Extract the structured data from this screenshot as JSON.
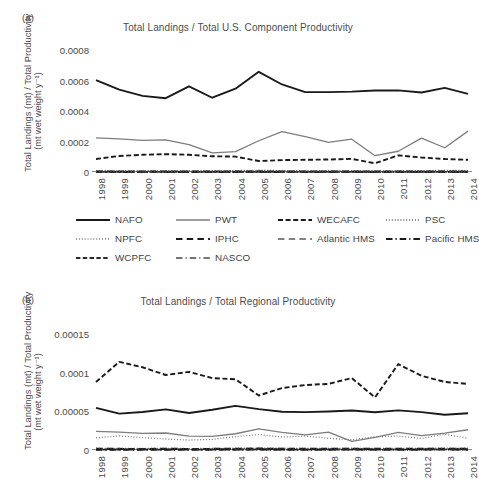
{
  "figure": {
    "panel_a_label": "(a)",
    "panel_b_label": "(b)",
    "ylabel_line1": "Total Landings (mt) / Total Productivity",
    "ylabel_line2": "(mt wet weight y⁻¹)"
  },
  "legend": {
    "rows": [
      [
        {
          "label": "NAFO",
          "style": "solid",
          "color": "#1a1a1a",
          "width": 1.9
        },
        {
          "label": "PWT",
          "style": "solid",
          "color": "#7d7d7d",
          "width": 1.3
        },
        {
          "label": "WECAFC",
          "style": "dashed",
          "color": "#1a1a1a",
          "width": 1.9
        },
        {
          "label": "PSC",
          "style": "dotted",
          "color": "#4a4a4a",
          "width": 1.4
        }
      ],
      [
        {
          "label": "NPFC",
          "style": "dotted",
          "color": "#6e6e6e",
          "width": 1.3
        },
        {
          "label": "IPHC",
          "style": "longdash",
          "color": "#1a1a1a",
          "width": 2.1
        },
        {
          "label": "Atlantic HMS",
          "style": "longdash",
          "color": "#5a5a5a",
          "width": 1.5
        },
        {
          "label": "Pacific HMS",
          "style": "dashdot",
          "color": "#1a1a1a",
          "width": 2.0
        }
      ],
      [
        {
          "label": "WCPFC",
          "style": "meddash",
          "color": "#2a2a2a",
          "width": 1.8
        },
        {
          "label": "NASCO",
          "style": "dashdot",
          "color": "#4a4a4a",
          "width": 1.5
        }
      ]
    ]
  },
  "chart_data": [
    {
      "type": "line",
      "panel": "a",
      "title": "Total Landings / Total U.S. Component Productivity",
      "xlabel": "",
      "ylabel": "Total Landings (mt) / Total Productivity (mt wet weight y⁻¹)",
      "x": [
        1998,
        1999,
        2000,
        2001,
        2002,
        2003,
        2004,
        2005,
        2006,
        2007,
        2008,
        2009,
        2010,
        2011,
        2012,
        2013,
        2014
      ],
      "xtick_labels": [
        "1998",
        "1999",
        "2000",
        "2001",
        "2002",
        "2003",
        "2004",
        "2005",
        "2006",
        "2007",
        "2008",
        "2009",
        "2010",
        "2011",
        "2012",
        "2013",
        "2014"
      ],
      "ylim": [
        0,
        0.0008
      ],
      "yticks": [
        0,
        0.0002,
        0.0004,
        0.0006,
        0.0008
      ],
      "ytick_labels": [
        "0",
        "0.0002",
        "0.0004",
        "0.0006",
        "0.0008"
      ],
      "grid": false,
      "legend_position": "below",
      "series": [
        {
          "name": "NAFO",
          "style": "solid",
          "color": "#1a1a1a",
          "width": 1.9,
          "values": [
            0.000602,
            0.00054,
            0.000499,
            0.000484,
            0.000562,
            0.000487,
            0.000546,
            0.000657,
            0.000574,
            0.000524,
            0.000524,
            0.000527,
            0.000534,
            0.000535,
            0.000521,
            0.000552,
            0.000512,
            0.000481,
            0.000521
          ]
        },
        {
          "name": "PWT",
          "style": "solid",
          "color": "#7d7d7d",
          "width": 1.3,
          "values": [
            0.000224,
            0.000217,
            0.000208,
            0.00021,
            0.000179,
            0.000126,
            0.000134,
            0.000205,
            0.000265,
            0.000232,
            0.000194,
            0.000215,
            0.000107,
            0.000136,
            0.000222,
            0.000159,
            0.000268
          ]
        },
        {
          "name": "WECAFC",
          "style": "dashed",
          "color": "#1a1a1a",
          "width": 1.9,
          "values": [
            8.5e-05,
            0.000105,
            0.000113,
            0.000117,
            0.000113,
            0.000103,
            0.000101,
            7.2e-05,
            7.8e-05,
            8e-05,
            8.2e-05,
            8.6e-05,
            5.7e-05,
            0.000109,
            9.5e-05,
            8.5e-05,
            8e-05
          ]
        },
        {
          "name": "PSC",
          "style": "dotted",
          "color": "#4a4a4a",
          "width": 1.4,
          "values": [
            8.5e-06,
            7.5e-06,
            7e-06,
            8e-06,
            6.8e-06,
            7.2e-06,
            9e-06,
            1.1e-05,
            8.6e-06,
            7.5e-06,
            8e-06,
            8.8e-06,
            7.2e-06,
            7.8e-06,
            8.2e-06,
            1.05e-05,
            9e-06
          ]
        },
        {
          "name": "NPFC",
          "style": "dotted",
          "color": "#6e6e6e",
          "width": 1.3,
          "values": [
            5e-06,
            4.5e-06,
            4.2e-06,
            4.8e-06,
            4e-06,
            4.4e-06,
            5.2e-06,
            6e-06,
            5e-06,
            4.6e-06,
            4.8e-06,
            5.2e-06,
            4.4e-06,
            4.7e-06,
            4.9e-06,
            5.8e-06,
            5.2e-06
          ]
        },
        {
          "name": "IPHC",
          "style": "longdash",
          "color": "#1a1a1a",
          "width": 2.1,
          "values": [
            3.2e-06,
            3e-06,
            2.8e-06,
            3.1e-06,
            2.7e-06,
            2.9e-06,
            3.4e-06,
            3.8e-06,
            3.3e-06,
            3e-06,
            3.1e-06,
            3.4e-06,
            2.9e-06,
            3.1e-06,
            3.2e-06,
            3.7e-06,
            3.4e-06
          ]
        },
        {
          "name": "Atlantic HMS",
          "style": "longdash",
          "color": "#5a5a5a",
          "width": 1.5,
          "values": [
            2.2e-06,
            2.1e-06,
            2e-06,
            2.2e-06,
            1.9e-06,
            2e-06,
            2.3e-06,
            2.6e-06,
            2.3e-06,
            2.1e-06,
            2.2e-06,
            2.3e-06,
            2e-06,
            2.2e-06,
            2.2e-06,
            2.5e-06,
            2.3e-06
          ]
        },
        {
          "name": "Pacific HMS",
          "style": "dashdot",
          "color": "#1a1a1a",
          "width": 2.0,
          "values": [
            1.6e-06,
            1.5e-06,
            1.4e-06,
            1.6e-06,
            1.4e-06,
            1.5e-06,
            1.7e-06,
            1.9e-06,
            1.6e-06,
            1.5e-06,
            1.6e-06,
            1.7e-06,
            1.5e-06,
            1.6e-06,
            1.6e-06,
            1.8e-06,
            1.7e-06
          ]
        },
        {
          "name": "WCPFC",
          "style": "meddash",
          "color": "#2a2a2a",
          "width": 1.8,
          "values": [
            1.2e-06,
            1.1e-06,
            1e-06,
            1.2e-06,
            1e-06,
            1.1e-06,
            1.3e-06,
            1.4e-06,
            1.2e-06,
            1.1e-06,
            1.2e-06,
            1.3e-06,
            1.1e-06,
            1.2e-06,
            1.2e-06,
            1.3e-06,
            1.2e-06
          ]
        },
        {
          "name": "NASCO",
          "style": "dashdot",
          "color": "#4a4a4a",
          "width": 1.5,
          "values": [
            6e-07,
            6e-07,
            5e-07,
            6e-07,
            5e-07,
            6e-07,
            7e-07,
            7e-07,
            6e-07,
            6e-07,
            6e-07,
            7e-07,
            6e-07,
            6e-07,
            6e-07,
            7e-07,
            6e-07
          ]
        }
      ]
    },
    {
      "type": "line",
      "panel": "b",
      "title": "Total Landings / Total Regional Productivity",
      "xlabel": "",
      "ylabel": "Total Landings (mt) / Total Productivity (mt wet weight y⁻¹)",
      "x": [
        1998,
        1999,
        2000,
        2001,
        2002,
        2003,
        2004,
        2005,
        2006,
        2007,
        2008,
        2009,
        2010,
        2011,
        2012,
        2013,
        2014
      ],
      "xtick_labels": [
        "1998",
        "1999",
        "2000",
        "2001",
        "2002",
        "2003",
        "2004",
        "2005",
        "2006",
        "2007",
        "2008",
        "2009",
        "2010",
        "2011",
        "2012",
        "2013",
        "2014"
      ],
      "ylim": [
        0,
        0.00015
      ],
      "yticks": [
        0,
        5e-05,
        0.0001,
        0.00015
      ],
      "ytick_labels": [
        "0",
        "0.00005",
        "0.0001",
        "0.00015"
      ],
      "grid": false,
      "legend_position": "above",
      "series": [
        {
          "name": "WECAFC",
          "style": "dashed",
          "color": "#1a1a1a",
          "width": 1.9,
          "values": [
            8.8e-05,
            0.000114,
            0.000107,
            9.7e-05,
            0.000101,
            9.3e-05,
            9.15e-05,
            7.05e-05,
            8e-05,
            8.4e-05,
            8.55e-05,
            9.3e-05,
            6.8e-05,
            0.000111,
            9.6e-05,
            8.8e-05,
            8.55e-05
          ]
        },
        {
          "name": "NAFO",
          "style": "solid",
          "color": "#1a1a1a",
          "width": 1.9,
          "values": [
            5.45e-05,
            4.7e-05,
            4.92e-05,
            5.25e-05,
            4.78e-05,
            5.2e-05,
            5.7e-05,
            5.28e-05,
            4.95e-05,
            4.9e-05,
            4.98e-05,
            5.1e-05,
            4.88e-05,
            5.12e-05,
            4.9e-05,
            4.55e-05,
            4.75e-05
          ]
        },
        {
          "name": "PWT",
          "style": "solid",
          "color": "#7d7d7d",
          "width": 1.3,
          "values": [
            2.4e-05,
            2.32e-05,
            2.15e-05,
            2.2e-05,
            1.8e-05,
            1.75e-05,
            2.1e-05,
            2.72e-05,
            2.28e-05,
            1.95e-05,
            2.32e-05,
            1.12e-05,
            1.62e-05,
            2.28e-05,
            1.85e-05,
            2.18e-05,
            2.62e-05
          ]
        },
        {
          "name": "NPFC",
          "style": "dotted",
          "color": "#6e6e6e",
          "width": 1.3,
          "values": [
            1.58e-05,
            1.82e-05,
            1.6e-05,
            1.42e-05,
            1.28e-05,
            1.38e-05,
            1.72e-05,
            2e-05,
            1.68e-05,
            1.8e-05,
            1.52e-05,
            1.32e-05,
            1.72e-05,
            1.8e-05,
            1.5e-05,
            2.05e-05,
            1.52e-05
          ]
        },
        {
          "name": "PSC",
          "style": "dotted",
          "color": "#4a4a4a",
          "width": 1.4,
          "values": [
            2.2e-06,
            2e-06,
            1.9e-06,
            2.1e-06,
            1.8e-06,
            1.9e-06,
            2.2e-06,
            2.5e-06,
            2.2e-06,
            2e-06,
            2.1e-06,
            2.2e-06,
            1.9e-06,
            2.1e-06,
            2.1e-06,
            2.4e-06,
            2.2e-06
          ]
        },
        {
          "name": "IPHC",
          "style": "longdash",
          "color": "#1a1a1a",
          "width": 2.1,
          "values": [
            1.5e-06,
            1.4e-06,
            1.3e-06,
            1.5e-06,
            1.3e-06,
            1.4e-06,
            1.6e-06,
            1.8e-06,
            1.5e-06,
            1.4e-06,
            1.5e-06,
            1.6e-06,
            1.4e-06,
            1.5e-06,
            1.5e-06,
            1.7e-06,
            1.6e-06
          ]
        },
        {
          "name": "Atlantic HMS",
          "style": "longdash",
          "color": "#5a5a5a",
          "width": 1.5,
          "values": [
            1.1e-06,
            1e-06,
            1e-06,
            1.1e-06,
            9e-07,
            1e-06,
            1.1e-06,
            1.3e-06,
            1.1e-06,
            1e-06,
            1.1e-06,
            1.1e-06,
            1e-06,
            1.1e-06,
            1.1e-06,
            1.2e-06,
            1.1e-06
          ]
        },
        {
          "name": "Pacific HMS",
          "style": "dashdot",
          "color": "#1a1a1a",
          "width": 2.0,
          "values": [
            8e-07,
            8e-07,
            7e-07,
            8e-07,
            7e-07,
            8e-07,
            9e-07,
            9e-07,
            8e-07,
            8e-07,
            8e-07,
            9e-07,
            8e-07,
            8e-07,
            8e-07,
            9e-07,
            8e-07
          ]
        },
        {
          "name": "WCPFC",
          "style": "meddash",
          "color": "#2a2a2a",
          "width": 1.8,
          "values": [
            6e-07,
            6e-07,
            5e-07,
            6e-07,
            5e-07,
            6e-07,
            6e-07,
            7e-07,
            6e-07,
            6e-07,
            6e-07,
            6e-07,
            6e-07,
            6e-07,
            6e-07,
            7e-07,
            6e-07
          ]
        },
        {
          "name": "NASCO",
          "style": "dashdot",
          "color": "#4a4a4a",
          "width": 1.5,
          "values": [
            3e-07,
            3e-07,
            3e-07,
            3e-07,
            3e-07,
            3e-07,
            4e-07,
            4e-07,
            3e-07,
            3e-07,
            3e-07,
            4e-07,
            3e-07,
            3e-07,
            3e-07,
            4e-07,
            3e-07
          ]
        }
      ]
    }
  ]
}
